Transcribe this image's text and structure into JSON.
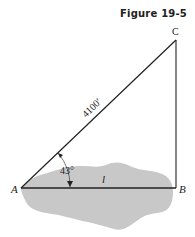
{
  "figure": {
    "title": "Figure 19-5",
    "vertices": {
      "A": "A",
      "B": "B",
      "C": "C"
    },
    "hypotenuse_label": "4100′",
    "angle_label": "43°",
    "base_label": "l"
  },
  "colors": {
    "line": "#222222",
    "shade": "#c8c8c8"
  }
}
